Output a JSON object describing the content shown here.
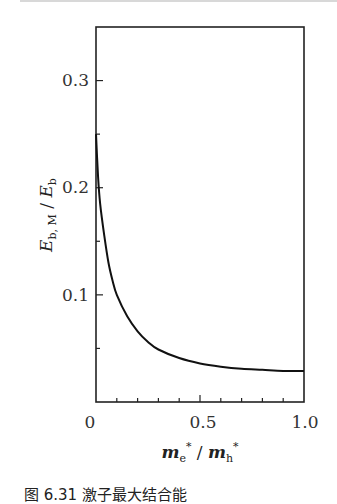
{
  "chart_data": {
    "type": "line",
    "title": "",
    "xlabel": "m_e* / m_h*",
    "ylabel": "E_b,M / E_b",
    "xlim": [
      0,
      1.0
    ],
    "ylim": [
      0,
      0.35
    ],
    "x_ticks": [
      "0",
      "0.5",
      "1.0"
    ],
    "y_ticks": [
      "0.1",
      "0.2",
      "0.3"
    ],
    "grid": false,
    "legend": null,
    "series": [
      {
        "name": "E_b,M / E_b",
        "x": [
          0.0,
          0.01,
          0.02,
          0.04,
          0.06,
          0.08,
          0.1,
          0.15,
          0.2,
          0.25,
          0.3,
          0.4,
          0.5,
          0.6,
          0.7,
          0.8,
          0.9,
          1.0
        ],
        "y": [
          0.25,
          0.21,
          0.185,
          0.155,
          0.13,
          0.113,
          0.1,
          0.08,
          0.066,
          0.056,
          0.049,
          0.041,
          0.036,
          0.033,
          0.031,
          0.03,
          0.029,
          0.029
        ]
      }
    ]
  },
  "labels": {
    "x_tick_0": "0",
    "x_tick_05": "0.5",
    "x_tick_1": "1.0",
    "y_tick_01": "0.1",
    "y_tick_02": "0.2",
    "y_tick_03": "0.3",
    "caption": "图 6.31  激子最大结合能"
  }
}
